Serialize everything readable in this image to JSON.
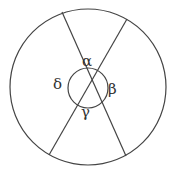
{
  "diagram": {
    "stroke_color": "#444444",
    "outer_circle": {
      "cx": 88,
      "cy": 87,
      "r": 78
    },
    "chords": [
      {
        "x1": 62,
        "y1": 12,
        "x2": 126,
        "y2": 156
      },
      {
        "x1": 127,
        "y1": 19,
        "x2": 49,
        "y2": 155
      }
    ],
    "angle_arc": {
      "cx": 88,
      "cy": 88,
      "r": 20
    },
    "labels": {
      "alpha": "α",
      "beta": "β",
      "gamma": "γ",
      "delta": "δ"
    }
  }
}
